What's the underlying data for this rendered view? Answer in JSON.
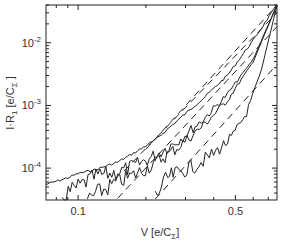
{
  "chart_data": {
    "type": "line",
    "title": "",
    "xlabel": "V  [e/C_Σ]",
    "ylabel": "I·R_1  [e/C_Σ]",
    "xscale": "log",
    "yscale": "log",
    "xlim": [
      0.072,
      0.765
    ],
    "ylim": [
      3.1e-05,
      0.04
    ],
    "grid": false,
    "legend": null,
    "x_ticks": [
      {
        "value": 0.1,
        "label": "0.1"
      },
      {
        "value": 0.5,
        "label": "0.5"
      }
    ],
    "y_ticks": [
      {
        "value": 0.01,
        "label": "10",
        "exp": "-2"
      },
      {
        "value": 0.001,
        "label": "10",
        "exp": "-3"
      },
      {
        "value": 0.0001,
        "label": "10",
        "exp": "-4"
      }
    ],
    "series": [
      {
        "name": "measured-1",
        "style": "solid",
        "x": [
          0.072,
          0.09,
          0.1,
          0.12,
          0.15,
          0.18,
          0.22,
          0.28,
          0.36,
          0.46,
          0.6,
          0.765
        ],
        "y": [
          5.5e-05,
          7e-05,
          8.2e-05,
          9.5e-05,
          0.000125,
          0.00018,
          0.00028,
          0.0006,
          0.0013,
          0.003,
          0.011,
          0.04
        ]
      },
      {
        "name": "measured-2",
        "style": "solid",
        "x": [
          0.085,
          0.1,
          0.12,
          0.15,
          0.18,
          0.22,
          0.28,
          0.36,
          0.46,
          0.6,
          0.765
        ],
        "y": [
          3.5e-05,
          5e-05,
          7.5e-05,
          8.5e-05,
          0.00011,
          0.00016,
          0.00028,
          0.0006,
          0.0015,
          0.0055,
          0.04
        ]
      },
      {
        "name": "measured-3",
        "style": "solid",
        "x": [
          0.11,
          0.13,
          0.15,
          0.18,
          0.22,
          0.28,
          0.36,
          0.46,
          0.6,
          0.765
        ],
        "y": [
          3.2e-05,
          4.5e-05,
          6e-05,
          8e-05,
          0.00012,
          0.00022,
          0.00048,
          0.0012,
          0.005,
          0.04
        ]
      },
      {
        "name": "measured-4",
        "style": "solid",
        "x": [
          0.22,
          0.25,
          0.28,
          0.33,
          0.4,
          0.48,
          0.56,
          0.65,
          0.765
        ],
        "y": [
          3.5e-05,
          7e-05,
          8.5e-05,
          0.00011,
          0.00017,
          0.0003,
          0.00075,
          0.0035,
          0.04
        ]
      },
      {
        "name": "fit-1",
        "style": "dashed",
        "x": [
          0.2,
          0.765
        ],
        "y": [
          0.0002,
          0.04
        ]
      },
      {
        "name": "fit-2",
        "style": "dashed",
        "x": [
          0.16,
          0.765
        ],
        "y": [
          9e-05,
          0.03
        ]
      },
      {
        "name": "fit-3",
        "style": "dashed",
        "x": [
          0.15,
          0.765
        ],
        "y": [
          3.3e-05,
          0.018
        ]
      },
      {
        "name": "fit-4",
        "style": "dashed",
        "x": [
          0.22,
          0.765
        ],
        "y": [
          3.2e-05,
          0.0045
        ]
      }
    ]
  },
  "labels": {
    "xlabel_main": "V  [e/C",
    "xlabel_sub": "Σ",
    "xlabel_end": "]",
    "ylabel_main": "I·R",
    "ylabel_sub1": "1",
    "ylabel_mid": "  [e/C",
    "ylabel_sub2": "Σ",
    "ylabel_end": " ]"
  }
}
